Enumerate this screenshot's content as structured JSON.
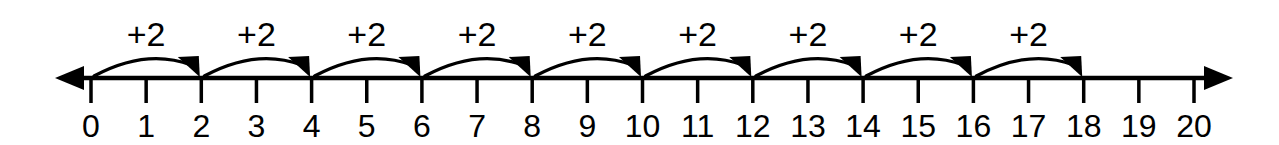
{
  "figure": {
    "name": "skip-counting-number-line",
    "background_color": "#ffffff",
    "ink_color": "#000000"
  },
  "chart_data": {
    "type": "line",
    "title": "",
    "xlabel": "",
    "ylabel": "",
    "xlim": [
      0,
      20
    ],
    "grid": false,
    "legend": null,
    "axis": {
      "orientation": "horizontal",
      "left_arrowhead": true,
      "right_arrowhead": true,
      "tick_min": 0,
      "tick_max": 20,
      "tick_step": 1
    },
    "categories": [
      "0",
      "1",
      "2",
      "3",
      "4",
      "5",
      "6",
      "7",
      "8",
      "9",
      "10",
      "11",
      "12",
      "13",
      "14",
      "15",
      "16",
      "17",
      "18",
      "19",
      "20"
    ],
    "values": [
      0,
      1,
      2,
      3,
      4,
      5,
      6,
      7,
      8,
      9,
      10,
      11,
      12,
      13,
      14,
      15,
      16,
      17,
      18,
      19,
      20
    ],
    "annotations": [
      {
        "label": "+2",
        "from": 0,
        "to": 2,
        "midpoint": 1
      },
      {
        "label": "+2",
        "from": 2,
        "to": 4,
        "midpoint": 3
      },
      {
        "label": "+2",
        "from": 4,
        "to": 6,
        "midpoint": 5
      },
      {
        "label": "+2",
        "from": 6,
        "to": 8,
        "midpoint": 7
      },
      {
        "label": "+2",
        "from": 8,
        "to": 10,
        "midpoint": 9
      },
      {
        "label": "+2",
        "from": 10,
        "to": 12,
        "midpoint": 11
      },
      {
        "label": "+2",
        "from": 12,
        "to": 14,
        "midpoint": 13
      },
      {
        "label": "+2",
        "from": 14,
        "to": 16,
        "midpoint": 15
      },
      {
        "label": "+2",
        "from": 16,
        "to": 18,
        "midpoint": 17
      }
    ]
  },
  "tick_labels": [
    {
      "text": "0"
    },
    {
      "text": "1"
    },
    {
      "text": "2"
    },
    {
      "text": "3"
    },
    {
      "text": "4"
    },
    {
      "text": "5"
    },
    {
      "text": "6"
    },
    {
      "text": "7"
    },
    {
      "text": "8"
    },
    {
      "text": "9"
    },
    {
      "text": "10"
    },
    {
      "text": "11"
    },
    {
      "text": "12"
    },
    {
      "text": "13"
    },
    {
      "text": "14"
    },
    {
      "text": "15"
    },
    {
      "text": "16"
    },
    {
      "text": "17"
    },
    {
      "text": "18"
    },
    {
      "text": "19"
    },
    {
      "text": "20"
    }
  ],
  "hops": [
    {
      "label": "+2"
    },
    {
      "label": "+2"
    },
    {
      "label": "+2"
    },
    {
      "label": "+2"
    },
    {
      "label": "+2"
    },
    {
      "label": "+2"
    },
    {
      "label": "+2"
    },
    {
      "label": "+2"
    },
    {
      "label": "+2"
    }
  ]
}
